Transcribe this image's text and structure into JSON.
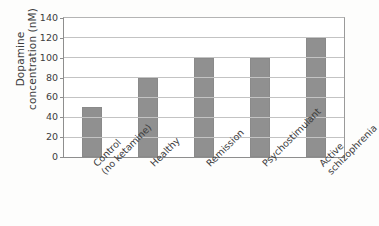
{
  "chart_data": {
    "type": "bar",
    "title": "",
    "xlabel": "",
    "ylabel": "Dopamine concentration (nM)",
    "ylabel_lines": [
      "Dopamine",
      "concentration (nM)"
    ],
    "categories": [
      "Control (no ketamine)",
      "Healthy",
      "Remission",
      "Psychostimulant",
      "Active schizophrenia"
    ],
    "category_lines": [
      [
        "Control",
        "(no ketamine)"
      ],
      [
        "Healthy",
        ""
      ],
      [
        "Remission",
        ""
      ],
      [
        "Psychostimulant",
        ""
      ],
      [
        "Active",
        "schizophrenia"
      ]
    ],
    "values": [
      50,
      80,
      100,
      100,
      120
    ],
    "ylim": [
      0,
      140
    ],
    "yticks": [
      0,
      20,
      40,
      60,
      80,
      100,
      120,
      140
    ],
    "ytick_labels": [
      "0",
      "20",
      "40",
      "60",
      "80",
      "100",
      "120",
      "140"
    ],
    "grid": true,
    "legend": "none",
    "bar_color": "#909090",
    "grid_color": "#c3c3c3",
    "axis_color": "#8e8e8e",
    "background_color": "#ffffff"
  }
}
